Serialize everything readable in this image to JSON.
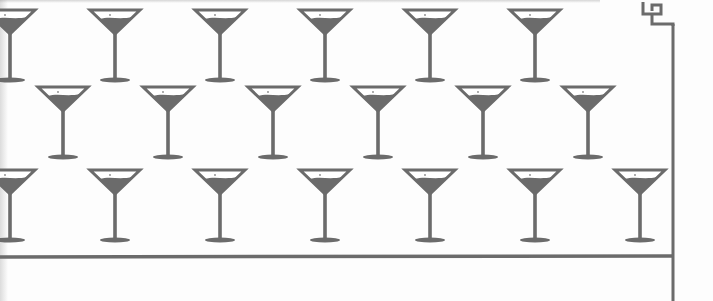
{
  "pattern": {
    "name": "martini-glass-border-pattern",
    "colors": {
      "ink": "#6b6b6b",
      "background": "#fdfdfd",
      "rim_fill": "#ffffff"
    },
    "glass": {
      "rim_width": 50,
      "bowl_height": 24,
      "stem_height": 46,
      "base_width": 30
    },
    "rows": [
      {
        "rim_y": 10,
        "centers_x": [
          10,
          115,
          220,
          325,
          430,
          535
        ]
      },
      {
        "rim_y": 87,
        "centers_x": [
          63,
          168,
          273,
          378,
          483,
          588
        ]
      },
      {
        "rim_y": 170,
        "centers_x": [
          10,
          115,
          220,
          325,
          430,
          535,
          640
        ]
      }
    ],
    "border": {
      "bottom_line_y": 257,
      "right_line_x": 673,
      "greek_key_corner": {
        "x": 643,
        "y": 2
      }
    }
  }
}
